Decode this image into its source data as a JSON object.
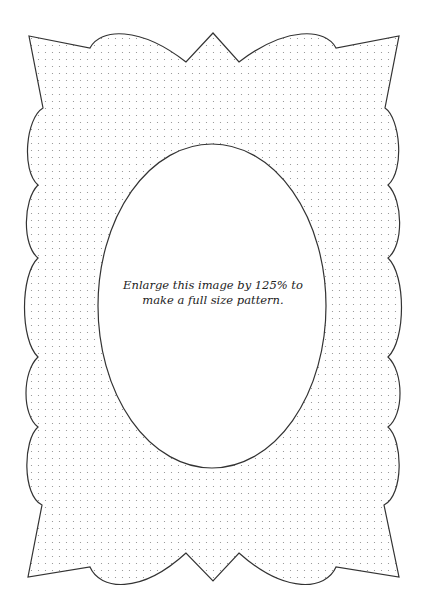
{
  "page": {
    "instruction": {
      "line1": "Enlarge this image by 125% to",
      "line2": "make a full size pattern."
    }
  },
  "pattern": {
    "fill": "dotted-grid",
    "dot_spacing_px": 7,
    "dot_color": "#8a8a8a",
    "outline_color": "#333333",
    "background": "#ffffff",
    "oval_window": {
      "cx": 212,
      "cy": 306,
      "rx": 114,
      "ry": 162
    }
  }
}
